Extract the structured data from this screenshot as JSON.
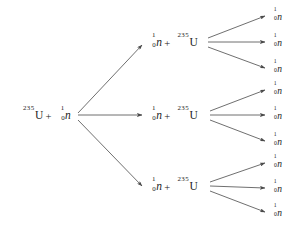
{
  "diagram": {
    "background_color": "#ffffff",
    "line_color": "#4a4a4a",
    "text_color": "#222222",
    "symbols": {
      "uranium_mass_number": "235",
      "uranium_symbol": "U",
      "neutron_mass_number": "1",
      "neutron_atomic_number": "0",
      "neutron_symbol": "n",
      "plus": "+"
    },
    "root": {
      "label_parts": {
        "first_sup": "235",
        "first_sub": "",
        "first_symbol": "U",
        "operator": "+",
        "second_sup": "1",
        "second_sub": "0",
        "second_symbol": "n"
      }
    },
    "generation2": [
      {
        "id": "node-g2-1",
        "label_parts": {
          "first_sup": "1",
          "first_sub": "0",
          "first_symbol": "n",
          "operator": "+",
          "second_sup": "235",
          "second_sub": "",
          "second_symbol": "U"
        }
      },
      {
        "id": "node-g2-2",
        "label_parts": {
          "first_sup": "1",
          "first_sub": "0",
          "first_symbol": "n",
          "operator": "+",
          "second_sup": "235",
          "second_sub": "",
          "second_symbol": "U"
        }
      },
      {
        "id": "node-g2-3",
        "label_parts": {
          "first_sup": "1",
          "first_sub": "0",
          "first_symbol": "n",
          "operator": "+",
          "second_sup": "235",
          "second_sub": "",
          "second_symbol": "U"
        }
      }
    ],
    "generation3": [
      {
        "id": "leaf-1",
        "sup": "1",
        "sub": "0",
        "symbol": "n"
      },
      {
        "id": "leaf-2",
        "sup": "1",
        "sub": "0",
        "symbol": "n"
      },
      {
        "id": "leaf-3",
        "sup": "1",
        "sub": "0",
        "symbol": "n"
      },
      {
        "id": "leaf-4",
        "sup": "1",
        "sub": "0",
        "symbol": "n"
      },
      {
        "id": "leaf-5",
        "sup": "1",
        "sub": "0",
        "symbol": "n"
      },
      {
        "id": "leaf-6",
        "sup": "1",
        "sub": "0",
        "symbol": "n"
      },
      {
        "id": "leaf-7",
        "sup": "1",
        "sub": "0",
        "symbol": "n"
      },
      {
        "id": "leaf-8",
        "sup": "1",
        "sub": "0",
        "symbol": "n"
      },
      {
        "id": "leaf-9",
        "sup": "1",
        "sub": "0",
        "symbol": "n"
      }
    ]
  }
}
